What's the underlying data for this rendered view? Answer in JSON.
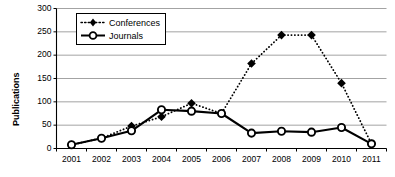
{
  "chart_data": {
    "type": "line",
    "title": "",
    "xlabel": "",
    "ylabel": "Publications",
    "categories": [
      "2001",
      "2002",
      "2003",
      "2004",
      "2005",
      "2006",
      "2007",
      "2008",
      "2009",
      "2010",
      "2011"
    ],
    "ylim": [
      0,
      300
    ],
    "yticks": [
      0,
      50,
      100,
      150,
      200,
      250,
      300
    ],
    "grid": true,
    "legend_position": "top-left-inside",
    "series": [
      {
        "name": "Conferences",
        "values": [
          8,
          22,
          48,
          68,
          97,
          75,
          182,
          243,
          243,
          140,
          10
        ],
        "line_style": "dotted",
        "marker": "diamond",
        "color": "#000000"
      },
      {
        "name": "Journals",
        "values": [
          8,
          22,
          38,
          83,
          80,
          75,
          33,
          37,
          35,
          45,
          10
        ],
        "line_style": "solid",
        "marker": "circle-open",
        "color": "#000000"
      }
    ]
  },
  "axis": {
    "y_title": "Publications",
    "y_tick_labels": [
      "300",
      "250",
      "200",
      "150",
      "100",
      "50",
      "0"
    ],
    "x_tick_labels": [
      "2001",
      "2002",
      "2003",
      "2004",
      "2005",
      "2006",
      "2007",
      "2008",
      "2009",
      "2010",
      "2011"
    ]
  },
  "legend": {
    "items": [
      {
        "label": "Conferences"
      },
      {
        "label": "Journals"
      }
    ]
  },
  "colors": {
    "ink": "#000000",
    "grid": "#8c8c8c",
    "background": "#ffffff"
  }
}
